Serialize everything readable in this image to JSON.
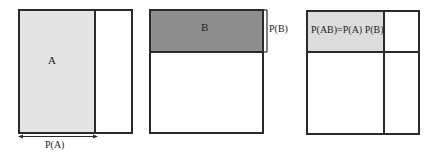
{
  "panels": [
    {
      "id": "panel-a",
      "region_label": "A",
      "measure_label": "P(A)",
      "region_fill": "#e4e4e4"
    },
    {
      "id": "panel-b",
      "region_label": "B",
      "measure_label": "P(B)",
      "region_fill": "#8e8e8e"
    },
    {
      "id": "panel-ab",
      "region_label": "P(AB)=P(A) P(B)",
      "region_fill": "#dcdcdc"
    }
  ],
  "colors": {
    "stroke": "#2a2a2a",
    "background": "#ffffff"
  }
}
